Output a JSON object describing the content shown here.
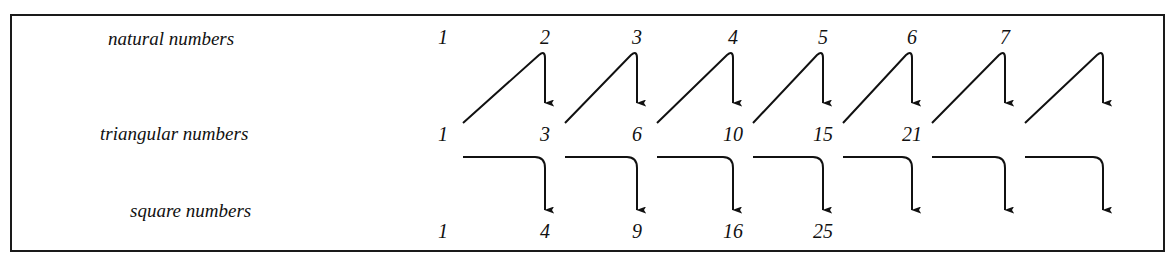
{
  "diagram": {
    "rows": [
      {
        "key": "natural",
        "label": "natural numbers",
        "values": [
          "1",
          "2",
          "3",
          "4",
          "5",
          "6",
          "7"
        ]
      },
      {
        "key": "triangular",
        "label": "triangular numbers",
        "values": [
          "1",
          "3",
          "6",
          "10",
          "15",
          "21"
        ]
      },
      {
        "key": "square",
        "label": "square numbers",
        "values": [
          "1",
          "4",
          "9",
          "16",
          "25"
        ]
      }
    ],
    "arrows": {
      "triangular_to_next": {
        "count": 7,
        "description": "triangular(n) + natural(n+1) = triangular(n+1)"
      },
      "triangular_to_square": {
        "count": 7,
        "description": "triangular(n) + triangular(n+1) = square(n+1)"
      }
    },
    "colors": {
      "ink": "#111111",
      "background": "#ffffff"
    }
  }
}
